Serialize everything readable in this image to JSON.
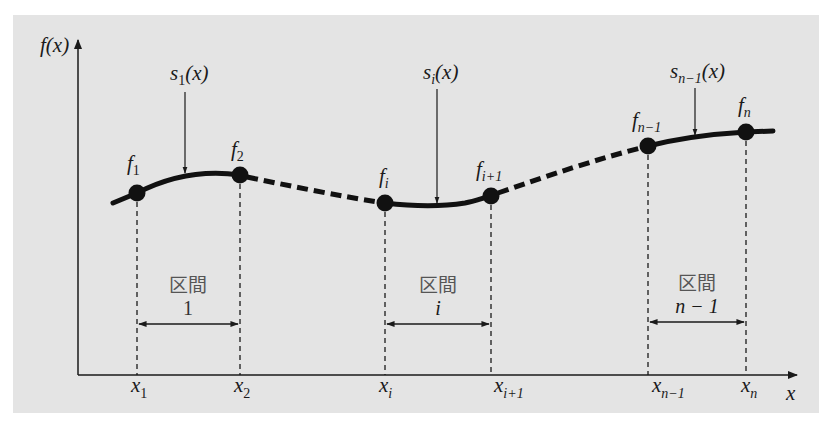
{
  "diagram": {
    "background_color": "#e4e4e4",
    "axes": {
      "y_label": "f(x)",
      "x_label": "x"
    },
    "knots": [
      {
        "f_base": "f",
        "f_sub": "1",
        "x_base": "x",
        "x_sub": "1"
      },
      {
        "f_base": "f",
        "f_sub": "2",
        "x_base": "x",
        "x_sub": "2"
      },
      {
        "f_base": "f",
        "f_sub": "i",
        "x_base": "x",
        "x_sub": "i"
      },
      {
        "f_base": "f",
        "f_sub": "i+1",
        "x_base": "x",
        "x_sub": "i+1"
      },
      {
        "f_base": "f",
        "f_sub": "n−1",
        "x_base": "x",
        "x_sub": "n−1"
      },
      {
        "f_base": "f",
        "f_sub": "n",
        "x_base": "x",
        "x_sub": "n"
      }
    ],
    "splines": [
      {
        "base": "s",
        "sub": "1",
        "arg": "(x)"
      },
      {
        "base": "s",
        "sub": "i",
        "arg": "(x)"
      },
      {
        "base": "s",
        "sub": "n−1",
        "arg": "(x)"
      }
    ],
    "intervals": [
      {
        "label": "区間",
        "index": "1"
      },
      {
        "label": "区間",
        "index": "i"
      },
      {
        "label": "区間",
        "index": "n − 1"
      }
    ]
  }
}
